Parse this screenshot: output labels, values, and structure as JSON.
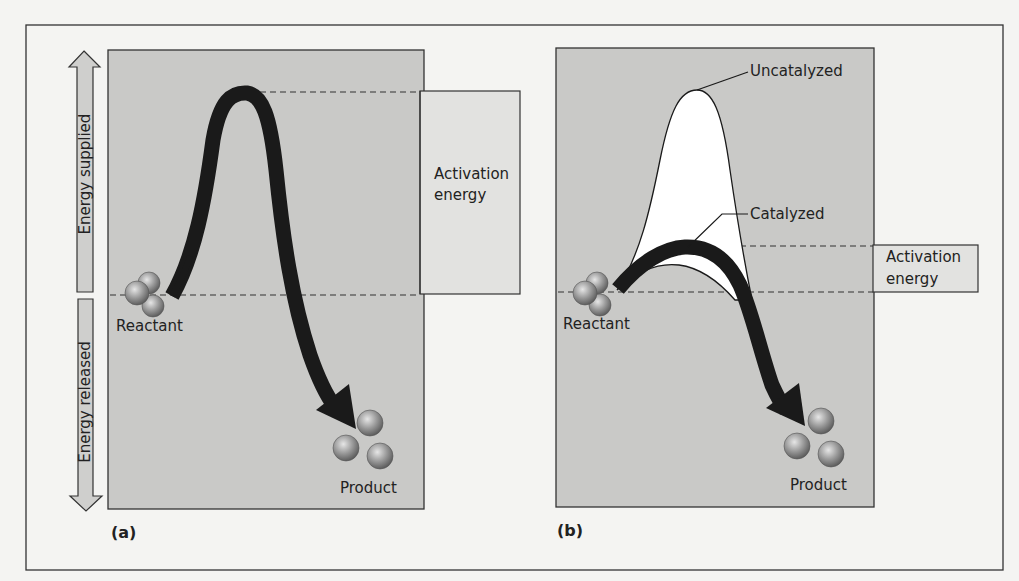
{
  "figure": {
    "panels": [
      {
        "id": "a",
        "tag": "(a)",
        "reactant_label": "Reactant",
        "product_label": "Product",
        "activation_label_line1": "Activation",
        "activation_label_line2": "energy"
      },
      {
        "id": "b",
        "tag": "(b)",
        "reactant_label": "Reactant",
        "product_label": "Product",
        "activation_label_line1": "Activation",
        "activation_label_line2": "energy",
        "uncatalyzed_label": "Uncatalyzed",
        "catalyzed_label": "Catalyzed"
      }
    ],
    "axis": {
      "up_label": "Energy supplied",
      "down_label": "Energy released"
    },
    "colors": {
      "panel_fill": "#c9c9c7",
      "activation_box_fill": "#e2e2e0",
      "curve": "#1a1a1a",
      "sphere": "#8a8a8a",
      "background": "#f4f4f2"
    }
  }
}
